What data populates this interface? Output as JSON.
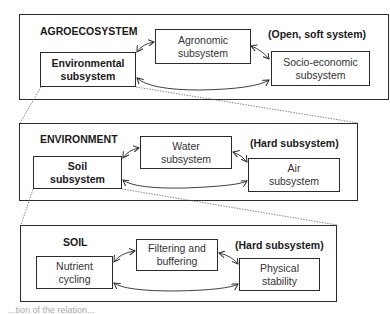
{
  "panels": [
    {
      "title": "AGROECOSYSTEM",
      "tag": "(Open, soft system)",
      "boxes": [
        {
          "label": "Environmental\nsubsystem",
          "bold": true
        },
        {
          "label": "Agronomic\nsubsystem",
          "bold": false
        },
        {
          "label": "Socio-economic\nsubsystem",
          "bold": false
        }
      ]
    },
    {
      "title": "ENVIRONMENT",
      "tag": "(Hard subsystem)",
      "boxes": [
        {
          "label": "Soil\nsubsystem",
          "bold": true
        },
        {
          "label": "Water\nsubsystem",
          "bold": false
        },
        {
          "label": "Air\nsubsystem",
          "bold": false
        }
      ]
    },
    {
      "title": "SOIL",
      "tag": "(Hard subsystem)",
      "boxes": [
        {
          "label": "Nutrient\ncycling",
          "bold": false
        },
        {
          "label": "Filtering and\nbuffering",
          "bold": false
        },
        {
          "label": "Physical\nstability",
          "bold": false
        }
      ]
    }
  ],
  "caption": "...tion of the relation..."
}
